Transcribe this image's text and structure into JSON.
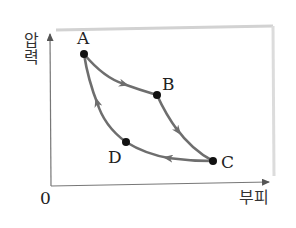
{
  "diagram": {
    "type": "pressure-volume cycle",
    "axes": {
      "y_label": "압력",
      "y_label_chars": [
        "압",
        "력"
      ],
      "x_label": "부피",
      "origin_label": "0"
    },
    "points": [
      {
        "id": "A",
        "label": "A"
      },
      {
        "id": "B",
        "label": "B"
      },
      {
        "id": "C",
        "label": "C"
      },
      {
        "id": "D",
        "label": "D"
      }
    ],
    "paths": [
      {
        "from": "A",
        "to": "B",
        "direction": "A→B"
      },
      {
        "from": "B",
        "to": "C",
        "direction": "B→C"
      },
      {
        "from": "C",
        "to": "D",
        "direction": "C→D"
      },
      {
        "from": "D",
        "to": "A",
        "direction": "D→A"
      }
    ],
    "colors": {
      "curve": "#6e6e6e",
      "axis": "#777777",
      "point": "#111111",
      "frame": "#d6d6d6"
    }
  }
}
